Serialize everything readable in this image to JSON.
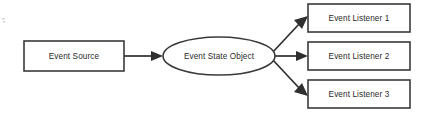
{
  "diagram": {
    "type": "flow-diagram",
    "background_color": "#ffffff",
    "stroke_color": "#3a3a3a",
    "text_color": "#2b2b2b",
    "nodes": [
      {
        "id": "event-source",
        "label": "Event Source",
        "shape": "rectangle",
        "x": 24,
        "y": 41,
        "width": 100,
        "height": 30
      },
      {
        "id": "event-state-object",
        "label": "Event State Object",
        "shape": "ellipse",
        "cx": 219,
        "cy": 56,
        "rx": 56,
        "ry": 19
      },
      {
        "id": "event-listener-1",
        "label": "Event Listener 1",
        "shape": "rectangle",
        "x": 308,
        "y": 4,
        "width": 102,
        "height": 28
      },
      {
        "id": "event-listener-2",
        "label": "Event Listener 2",
        "shape": "rectangle",
        "x": 308,
        "y": 42,
        "width": 102,
        "height": 28
      },
      {
        "id": "event-listener-3",
        "label": "Event Listener 3",
        "shape": "rectangle",
        "x": 308,
        "y": 80,
        "width": 102,
        "height": 28
      }
    ],
    "edges": [
      {
        "id": "edge-source-to-state",
        "from": "event-source",
        "to": "event-state-object",
        "direction": "right",
        "arrowhead": "end"
      },
      {
        "id": "edge-state-to-listener-1",
        "from": "event-state-object",
        "to": "event-listener-1",
        "direction": "up-right",
        "arrowhead": "end"
      },
      {
        "id": "edge-state-to-listener-2",
        "from": "event-state-object",
        "to": "event-listener-2",
        "direction": "right",
        "arrowhead": "end"
      },
      {
        "id": "edge-state-to-listener-3",
        "from": "event-state-object",
        "to": "event-listener-3",
        "direction": "down-right",
        "arrowhead": "end"
      }
    ]
  }
}
